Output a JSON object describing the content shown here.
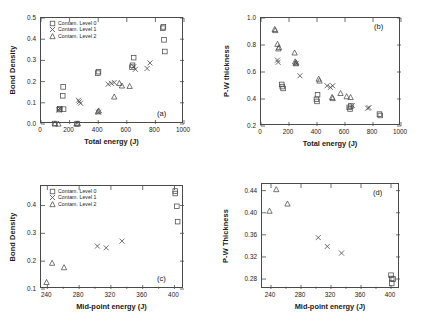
{
  "figure": {
    "panels": [
      "a",
      "b",
      "c",
      "d"
    ],
    "legend_labels": [
      "Contam. Level 0",
      "Contam. Level 1",
      "Contam. Level 2"
    ],
    "marker_shapes": [
      "square",
      "cross",
      "triangle"
    ],
    "line_color": "#4a4a4a"
  },
  "chart_data": [
    {
      "type": "scatter",
      "panel": "a",
      "title": "",
      "xlabel": "Total energy (J)",
      "ylabel": "Bond Density",
      "xlim": [
        0,
        1000
      ],
      "ylim": [
        0.0,
        0.5
      ],
      "xticks": [
        0,
        200,
        400,
        600,
        800,
        1000
      ],
      "yticks": [
        0.0,
        0.1,
        0.2,
        0.3,
        0.4,
        0.5
      ],
      "xtick_labels": [
        "0",
        "200",
        "400",
        "600",
        "800",
        "1000"
      ],
      "ytick_labels": [
        "0.0",
        "0.1",
        "0.2",
        "0.3",
        "0.4",
        "0.5"
      ],
      "grid": false,
      "legend_position": "upper-left",
      "series": [
        {
          "name": "Contam. Level 0",
          "marker": "square",
          "points": [
            [
              95,
              0.002
            ],
            [
              128,
              0.068
            ],
            [
              132,
              0.072
            ],
            [
              152,
              0.133
            ],
            [
              155,
              0.175
            ],
            [
              158,
              0.07
            ],
            [
              252,
              0.002
            ],
            [
              398,
              0.24
            ],
            [
              402,
              0.247
            ],
            [
              636,
              0.268
            ],
            [
              640,
              0.277
            ],
            [
              648,
              0.313
            ],
            [
              852,
              0.452
            ],
            [
              856,
              0.458
            ],
            [
              860,
              0.397
            ],
            [
              866,
              0.342
            ]
          ]
        },
        {
          "name": "Contam. Level 1",
          "marker": "cross",
          "points": [
            [
              125,
              0.066
            ],
            [
              130,
              0.073
            ],
            [
              262,
              0.112
            ],
            [
              268,
              0.105
            ],
            [
              276,
              0.098
            ],
            [
              402,
              0.056
            ],
            [
              470,
              0.188
            ],
            [
              492,
              0.192
            ],
            [
              512,
              0.196
            ],
            [
              660,
              0.258
            ],
            [
              742,
              0.262
            ],
            [
              762,
              0.288
            ],
            [
              648,
              0.27
            ]
          ]
        },
        {
          "name": "Contam. Level 2",
          "marker": "triangle",
          "points": [
            [
              98,
              0.001
            ],
            [
              122,
              0.0
            ],
            [
              248,
              0.0
            ],
            [
              258,
              0.001
            ],
            [
              398,
              0.058
            ],
            [
              404,
              0.062
            ],
            [
              512,
              0.128
            ],
            [
              548,
              0.192
            ],
            [
              566,
              0.18
            ],
            [
              620,
              0.178
            ]
          ]
        }
      ]
    },
    {
      "type": "scatter",
      "panel": "b",
      "title": "",
      "xlabel": "Total energy (J)",
      "ylabel": "P-W thickness",
      "xlim": [
        0,
        1000
      ],
      "ylim": [
        0.2,
        1.0
      ],
      "xticks": [
        0,
        200,
        400,
        600,
        800,
        1000
      ],
      "yticks": [
        0.2,
        0.4,
        0.6,
        0.8,
        1.0
      ],
      "xtick_labels": [
        "0",
        "200",
        "400",
        "600",
        "800",
        "1000"
      ],
      "ytick_labels": [
        "0.2",
        "0.4",
        "0.6",
        "0.8",
        "1.0"
      ],
      "grid": false,
      "legend_position": "none",
      "series": [
        {
          "name": "Contam. Level 0",
          "marker": "square",
          "points": [
            [
              148,
              0.508
            ],
            [
              152,
              0.492
            ],
            [
              158,
              0.478
            ],
            [
              396,
              0.398
            ],
            [
              400,
              0.382
            ],
            [
              404,
              0.432
            ],
            [
              630,
              0.338
            ],
            [
              636,
              0.326
            ],
            [
              642,
              0.348
            ],
            [
              846,
              0.288
            ],
            [
              852,
              0.278
            ]
          ]
        },
        {
          "name": "Contam. Level 1",
          "marker": "cross",
          "points": [
            [
              118,
              0.688
            ],
            [
              122,
              0.672
            ],
            [
              252,
              0.664
            ],
            [
              278,
              0.572
            ],
            [
              472,
              0.498
            ],
            [
              496,
              0.486
            ],
            [
              512,
              0.498
            ],
            [
              652,
              0.352
            ],
            [
              762,
              0.332
            ],
            [
              772,
              0.336
            ]
          ]
        },
        {
          "name": "Contam. Level 2",
          "marker": "triangle",
          "points": [
            [
              98,
              0.916
            ],
            [
              102,
              0.908
            ],
            [
              118,
              0.806
            ],
            [
              124,
              0.772
            ],
            [
              128,
              0.782
            ],
            [
              240,
              0.742
            ],
            [
              244,
              0.676
            ],
            [
              248,
              0.662
            ],
            [
              252,
              0.668
            ],
            [
              412,
              0.548
            ],
            [
              418,
              0.534
            ],
            [
              508,
              0.412
            ],
            [
              512,
              0.404
            ],
            [
              568,
              0.442
            ],
            [
              612,
              0.418
            ],
            [
              640,
              0.412
            ]
          ]
        }
      ]
    },
    {
      "type": "scatter",
      "panel": "c",
      "title": "",
      "xlabel": "Mid-point energy (J)",
      "ylabel": "Bond Density",
      "xlim": [
        232,
        412
      ],
      "ylim": [
        0.1,
        0.47
      ],
      "xticks": [
        240,
        280,
        320,
        360,
        400
      ],
      "yticks": [
        0.1,
        0.2,
        0.3,
        0.4
      ],
      "xtick_labels": [
        "240",
        "280",
        "320",
        "360",
        "400"
      ],
      "ytick_labels": [
        "0.1",
        "0.2",
        "0.3",
        "0.4"
      ],
      "grid": false,
      "legend_position": "upper-left",
      "series": [
        {
          "name": "Contam. Level 0",
          "marker": "square",
          "points": [
            [
              401,
              0.452
            ],
            [
              401,
              0.443
            ],
            [
              403,
              0.397
            ],
            [
              404,
              0.342
            ]
          ]
        },
        {
          "name": "Contam. Level 1",
          "marker": "cross",
          "points": [
            [
              303,
              0.254
            ],
            [
              314,
              0.248
            ],
            [
              334,
              0.272
            ]
          ]
        },
        {
          "name": "Contam. Level 2",
          "marker": "triangle",
          "points": [
            [
              239,
              0.124
            ],
            [
              246,
              0.193
            ],
            [
              261,
              0.177
            ]
          ]
        }
      ]
    },
    {
      "type": "scatter",
      "panel": "d",
      "title": "",
      "xlabel": "Mid-point energy (J)",
      "ylabel": "P-W Thickness",
      "xlim": [
        228,
        412
      ],
      "ylim": [
        0.262,
        0.452
      ],
      "xticks": [
        240,
        280,
        320,
        360,
        400
      ],
      "yticks": [
        0.28,
        0.32,
        0.36,
        0.4,
        0.44
      ],
      "xtick_labels": [
        "240",
        "280",
        "320",
        "360",
        "400"
      ],
      "ytick_labels": [
        "0.28",
        "0.32",
        "0.36",
        "0.40",
        "0.44"
      ],
      "grid": false,
      "legend_position": "none",
      "series": [
        {
          "name": "Contam. Level 0",
          "marker": "square",
          "points": [
            [
              400,
              0.287
            ],
            [
              401,
              0.281
            ],
            [
              403,
              0.28
            ],
            [
              401,
              0.272
            ]
          ]
        },
        {
          "name": "Contam. Level 1",
          "marker": "cross",
          "points": [
            [
              303,
              0.355
            ],
            [
              315,
              0.339
            ],
            [
              334,
              0.327
            ]
          ]
        },
        {
          "name": "Contam. Level 2",
          "marker": "triangle",
          "points": [
            [
              238,
              0.403
            ],
            [
              247,
              0.442
            ],
            [
              262,
              0.416
            ]
          ]
        }
      ]
    }
  ]
}
